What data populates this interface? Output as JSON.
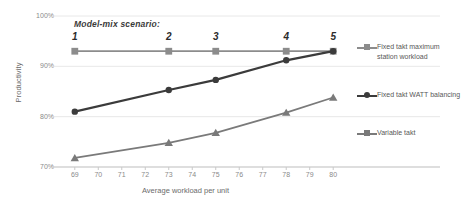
{
  "chart_data": {
    "type": "line",
    "title": "",
    "xlabel": "Average workload per unit",
    "ylabel": "Productivity",
    "xlim": [
      68.2,
      80.8
    ],
    "ylim": [
      0.7,
      1.0
    ],
    "xticks": [
      69,
      70,
      71,
      72,
      73,
      74,
      75,
      76,
      77,
      78,
      79,
      80
    ],
    "yticks": [
      "70%",
      "80%",
      "90%",
      "100%"
    ],
    "ytick_values": [
      0.7,
      0.8,
      0.9,
      1.0
    ],
    "grid": "horizontal",
    "legend_position": "right",
    "annotation_title": "Model-mix scenario:",
    "scenario_labels": [
      "1",
      "2",
      "3",
      "4",
      "5"
    ],
    "x": [
      69,
      73,
      75,
      78,
      80
    ],
    "series": [
      {
        "name": "Fixed takt maximum station workload",
        "marker": "square",
        "color": "#8c8c8c",
        "values": [
          0.93,
          0.93,
          0.93,
          0.93,
          0.93
        ]
      },
      {
        "name": "Fixed takt WATT balancing",
        "marker": "circle",
        "color": "#3b3b3b",
        "values": [
          0.81,
          0.853,
          0.873,
          0.912,
          0.93
        ]
      },
      {
        "name": "Variable takt",
        "marker": "triangle",
        "color": "#7a7a7a",
        "values": [
          0.718,
          0.748,
          0.768,
          0.808,
          0.838
        ]
      }
    ]
  },
  "legend": {
    "items": [
      {
        "label": "Fixed takt maximum station workload"
      },
      {
        "label": "Fixed takt WATT balancing"
      },
      {
        "label": "Variable takt"
      }
    ]
  },
  "axes": {
    "x_title": "Average workload per unit",
    "y_title": "Productivity"
  }
}
